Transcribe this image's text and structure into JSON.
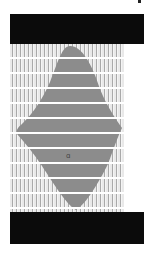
{
  "image": {
    "description": "Abstract composition: grey symmetric shape over vertical stripes between two black bars",
    "top_bar": {
      "text": ""
    },
    "bottom_bar": {
      "text": ""
    },
    "center_mark": "ɑ",
    "colors": {
      "background": "#ffffff",
      "bars": "#0b0b0b",
      "shape": "#8c8c8c",
      "stripe_dark": "#a9a9a9",
      "stripe_light": "#e9e9e9",
      "rule_lines": "#ffffff"
    }
  }
}
